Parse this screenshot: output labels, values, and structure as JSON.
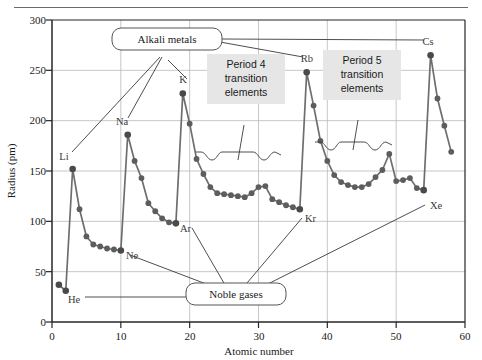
{
  "figure": {
    "name": "atomic-radius-vs-atomic-number",
    "top_rule": true
  },
  "chart_data": {
    "type": "line",
    "title": "",
    "xlabel": "Atomic number",
    "ylabel": "Radius (pm)",
    "xlim": [
      0,
      60
    ],
    "ylim": [
      0,
      300
    ],
    "xticks": [
      0,
      10,
      20,
      30,
      40,
      50,
      60
    ],
    "yticks": [
      0,
      50,
      100,
      150,
      200,
      250,
      300
    ],
    "grid": true,
    "legend": "none",
    "series": [
      {
        "name": "Atomic radius",
        "x": [
          1,
          2,
          3,
          4,
          5,
          6,
          7,
          8,
          9,
          10,
          11,
          12,
          13,
          14,
          15,
          16,
          17,
          18,
          19,
          20,
          21,
          22,
          23,
          24,
          25,
          26,
          27,
          28,
          29,
          30,
          31,
          32,
          33,
          34,
          35,
          36,
          37,
          38,
          39,
          40,
          41,
          42,
          43,
          44,
          45,
          46,
          47,
          48,
          49,
          50,
          51,
          52,
          53,
          54,
          55,
          56,
          57,
          58
        ],
        "values": [
          37,
          31,
          152,
          112,
          85,
          77,
          75,
          73,
          72,
          71,
          186,
          160,
          143,
          118,
          110,
          103,
          99,
          98,
          227,
          197,
          162,
          147,
          134,
          128,
          127,
          126,
          125,
          124,
          128,
          134,
          135,
          122,
          119,
          116,
          114,
          112,
          248,
          215,
          180,
          160,
          146,
          139,
          136,
          134,
          134,
          137,
          144,
          151,
          167,
          140,
          141,
          143,
          133,
          131,
          265,
          222,
          195,
          169
        ],
        "labeled_points": [
          {
            "symbol": "H",
            "x": 1,
            "y": 37
          },
          {
            "symbol": "He",
            "x": 2,
            "y": 31
          },
          {
            "symbol": "Li",
            "x": 3,
            "y": 152
          },
          {
            "symbol": "Ne",
            "x": 10,
            "y": 71
          },
          {
            "symbol": "Na",
            "x": 11,
            "y": 186
          },
          {
            "symbol": "Ar",
            "x": 18,
            "y": 98
          },
          {
            "symbol": "K",
            "x": 19,
            "y": 227
          },
          {
            "symbol": "Kr",
            "x": 36,
            "y": 112
          },
          {
            "symbol": "Rb",
            "x": 37,
            "y": 248
          },
          {
            "symbol": "Xe",
            "x": 54,
            "y": 131
          },
          {
            "symbol": "Cs",
            "x": 55,
            "y": 265
          }
        ]
      }
    ],
    "annotations": [
      {
        "id": "alkali-metals",
        "label": "Alkali metals",
        "style": "rounded-callout",
        "points_to": [
          "Li",
          "Na",
          "K",
          "Rb",
          "Cs"
        ]
      },
      {
        "id": "noble-gases",
        "label": "Noble gases",
        "style": "rounded-callout",
        "points_to": [
          "He",
          "Ne",
          "Ar",
          "Kr",
          "Xe"
        ]
      },
      {
        "id": "period-4-transition",
        "label": "Period 4\ntransition\nelements",
        "line1": "Period 4",
        "line2": "transition",
        "line3": "elements",
        "style": "shaded-box",
        "brace_range": [
          21,
          30
        ]
      },
      {
        "id": "period-5-transition",
        "label": "Period 5\ntransition\nelements",
        "line1": "Period 5",
        "line2": "transition",
        "line3": "elements",
        "style": "shaded-box",
        "brace_range": [
          39,
          48
        ]
      }
    ]
  },
  "colors": {
    "line": "#6e6e6e",
    "marker": "#5d5d5d",
    "grid": "#b9b9b9",
    "axis": "#262626",
    "text": "#1a1a1a",
    "callout_fill": "#ffffff",
    "callout_border": "#555555",
    "box_fill": "#e6e6e6",
    "leader": "#3a3a3a",
    "top_rule": "#6b6b6b"
  },
  "ticks": {
    "x": [
      "0",
      "10",
      "20",
      "30",
      "40",
      "50",
      "60"
    ],
    "y": [
      "0",
      "50",
      "100",
      "150",
      "200",
      "250",
      "300"
    ]
  },
  "labels": {
    "x_axis_title": "Atomic number",
    "y_axis_title": "Radius (pm)",
    "alkali_metals": "Alkali metals",
    "noble_gases": "Noble gases",
    "p4_line1": "Period 4",
    "p4_line2": "transition",
    "p4_line3": "elements",
    "p5_line1": "Period 5",
    "p5_line2": "transition",
    "p5_line3": "elements",
    "H": "H",
    "He": "He",
    "Li": "Li",
    "Ne": "Ne",
    "Na": "Na",
    "Ar": "Ar",
    "K": "K",
    "Kr": "Kr",
    "Rb": "Rb",
    "Xe": "Xe",
    "Cs": "Cs"
  }
}
